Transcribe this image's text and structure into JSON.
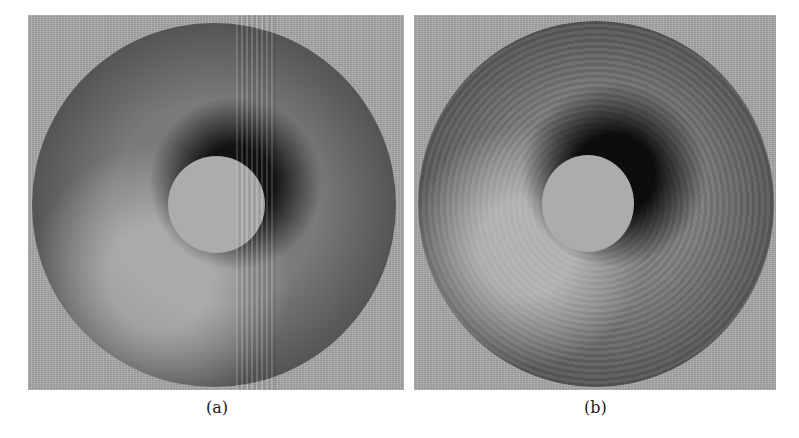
{
  "figure": {
    "panels": [
      {
        "id": "a",
        "label": "(a)",
        "description": "Rendered torus with noisy texture and vertical streak artifacts"
      },
      {
        "id": "b",
        "label": "(b)",
        "description": "Rendered torus with enhanced surface relief texture"
      }
    ],
    "colors": {
      "background": "#a9a9a9",
      "page": "#ffffff",
      "shadow": "#1e1e1e",
      "highlight": "#d2d2d2"
    }
  }
}
